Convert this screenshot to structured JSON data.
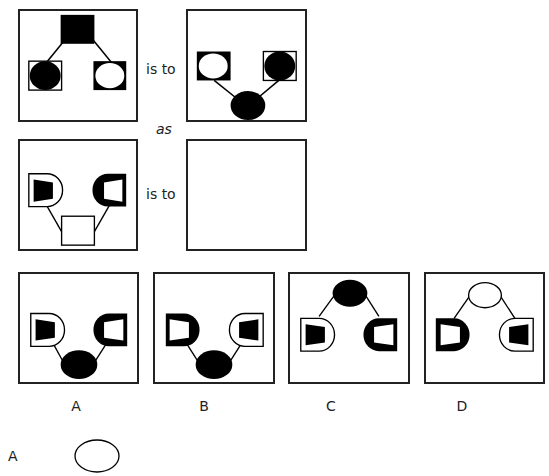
{
  "puzzle": {
    "relation_1": "is to",
    "connector": "as",
    "relation_2": "is to"
  },
  "panels": {
    "premise_a": {
      "description": "filled square top connected to bordered black circle (left) and black square with white circle (right)"
    },
    "premise_b": {
      "description": "black square with white circle (left) and bordered black circle (right) connected to black ellipse bottom"
    },
    "query": {
      "description": "white-D bordered black trapezoid (left), thick-black-D white trapezoid (right), connected to white square bottom"
    },
    "answer": {
      "description": "empty"
    }
  },
  "options": [
    {
      "label": "A"
    },
    {
      "label": "B"
    },
    {
      "label": "C"
    },
    {
      "label": "D"
    }
  ],
  "footer": {
    "answer_label": "A"
  },
  "colors": {
    "ink": "#000000",
    "border": "#222222",
    "background": "#ffffff"
  }
}
